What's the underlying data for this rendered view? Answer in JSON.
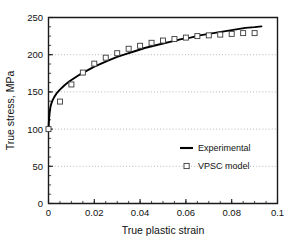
{
  "chart_data": {
    "type": "line",
    "title": "",
    "xlabel": "True plastic strain",
    "ylabel": "True stress, MPa",
    "xlim": [
      0,
      0.1
    ],
    "ylim": [
      0,
      250
    ],
    "xticks": [
      0,
      0.02,
      0.04,
      0.06,
      0.08,
      0.1
    ],
    "xticklabels": [
      "0",
      "0.02",
      "0.04",
      "0.06",
      "0.08",
      "0.1"
    ],
    "yticks": [
      0,
      50,
      100,
      150,
      200,
      250
    ],
    "yticklabels": [
      "0",
      "50",
      "100",
      "150",
      "200",
      "250"
    ],
    "xminor_step": 0.005,
    "yminor_step": 12.5,
    "grid": "horizontal-dotted",
    "gridlines_y": [
      50,
      100,
      150,
      200
    ],
    "legend_position": "center-right",
    "series": [
      {
        "name": "Experimental",
        "style": "line",
        "color": "#000000",
        "x": [
          0.0,
          0.0002,
          0.0005,
          0.0008,
          0.0012,
          0.0018,
          0.0025,
          0.0035,
          0.005,
          0.007,
          0.009,
          0.011,
          0.014,
          0.017,
          0.02,
          0.023,
          0.026,
          0.03,
          0.034,
          0.038,
          0.042,
          0.046,
          0.05,
          0.054,
          0.058,
          0.062,
          0.066,
          0.07,
          0.074,
          0.078,
          0.082,
          0.086,
          0.09,
          0.093
        ],
        "y": [
          100,
          112,
          122,
          129,
          134,
          139,
          143,
          148,
          153,
          159,
          164,
          168,
          174,
          179,
          184,
          188,
          192,
          197,
          201,
          205,
          209,
          212,
          215,
          218,
          221,
          223,
          226,
          228,
          230,
          232,
          234,
          236,
          237,
          238
        ]
      },
      {
        "name": "VPSC model",
        "style": "open-square-markers",
        "color": "#3a3a3a",
        "x": [
          0.0,
          0.005,
          0.01,
          0.015,
          0.02,
          0.025,
          0.03,
          0.035,
          0.04,
          0.045,
          0.05,
          0.055,
          0.06,
          0.065,
          0.07,
          0.075,
          0.08,
          0.085,
          0.09
        ],
        "y": [
          100,
          137,
          160,
          176,
          188,
          196,
          202,
          208,
          212,
          216,
          219,
          221,
          223,
          225,
          226,
          227,
          228,
          229,
          229
        ]
      }
    ]
  },
  "legend": {
    "items": [
      {
        "label": "Experimental",
        "marker": "line"
      },
      {
        "label": "VPSC model",
        "marker": "square"
      }
    ]
  }
}
